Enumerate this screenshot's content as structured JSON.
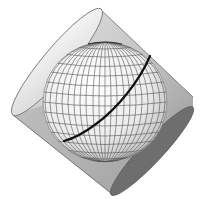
{
  "diagram": {
    "type": "map-projection-illustration",
    "elements": {
      "cylinder": {
        "label": "oblique-cylinder",
        "tilt_deg": 45
      },
      "globe": {
        "label": "globe-with-graticule",
        "meridians": 18,
        "parallels": 12
      },
      "tangent_line": {
        "label": "great-circle-tangent-line"
      }
    },
    "colors": {
      "background": "#ffffff",
      "cylinder_body": "#cfcfcf",
      "cylinder_body_dark": "#8a8a8a",
      "cap_top_fill": "#eeeeee",
      "cap_bottom_fill": "#6e6e6e",
      "globe_light": "#fafafa",
      "globe_dark": "#bdbdbd",
      "graticule": "#555555",
      "tangent_line": "#111111",
      "outline": "#7a7a7a"
    }
  }
}
